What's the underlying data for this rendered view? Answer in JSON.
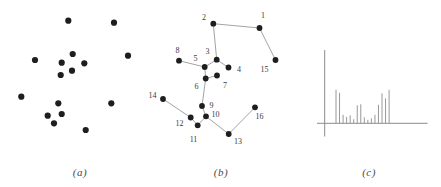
{
  "captions": {
    "a": "(a)",
    "b": "(b)",
    "c": "(c)"
  },
  "colors": {
    "dot": "#1e1e1e",
    "edge": "#999999",
    "axis": "#8c8c8c",
    "stem": "#8c8c8c",
    "node_label": "#3a3a3a",
    "caption": "#4a4a4a",
    "background": "#ffffff"
  },
  "chart_data": [
    {
      "panel": "a",
      "type": "scatter",
      "title": "(a)",
      "axes": "none",
      "points": [
        [
          68.3,
          20.7
        ],
        [
          114,
          22.7
        ],
        [
          35,
          60
        ],
        [
          72.7,
          54
        ],
        [
          61.7,
          62.7
        ],
        [
          84.3,
          63.3
        ],
        [
          128,
          55.7
        ],
        [
          60.7,
          75
        ],
        [
          72,
          70.7
        ],
        [
          21.3,
          96.7
        ],
        [
          58.3,
          103.3
        ],
        [
          111.3,
          103.3
        ],
        [
          47.7,
          115.7
        ],
        [
          61.7,
          114
        ],
        [
          54,
          123.3
        ],
        [
          85.7,
          130
        ]
      ]
    },
    {
      "panel": "b",
      "type": "scatter",
      "subtype": "minimum-spanning-tree",
      "title": "(b)",
      "axes": "none",
      "nodes": [
        {
          "id": "1",
          "x": 259.5,
          "y": 28,
          "lx": 263,
          "ly": 15.5
        },
        {
          "id": "2",
          "x": 213.3,
          "y": 23.7,
          "lx": 204,
          "ly": 17.5
        },
        {
          "id": "3",
          "x": 216.7,
          "y": 59.7,
          "lx": 207.5,
          "ly": 51.5
        },
        {
          "id": "4",
          "x": 228.5,
          "y": 67.5,
          "lx": 239,
          "ly": 69.5
        },
        {
          "id": "5",
          "x": 204.7,
          "y": 67,
          "lx": 195.5,
          "ly": 58.5
        },
        {
          "id": "6",
          "x": 205.7,
          "y": 78.5,
          "lx": 196.5,
          "ly": 86.5
        },
        {
          "id": "7",
          "x": 217,
          "y": 75.5,
          "lx": 225,
          "ly": 85
        },
        {
          "id": "8",
          "x": 179,
          "y": 60.7,
          "lx": 177.5,
          "ly": 50
        },
        {
          "id": "9",
          "x": 202,
          "y": 106,
          "lx": 211.5,
          "ly": 105
        },
        {
          "id": "10",
          "x": 206,
          "y": 116.3,
          "lx": 215.5,
          "ly": 114
        },
        {
          "id": "11",
          "x": 197.7,
          "y": 125.3,
          "lx": 193.5,
          "ly": 139
        },
        {
          "id": "12",
          "x": 190.7,
          "y": 117.5,
          "lx": 179.5,
          "ly": 123.5
        },
        {
          "id": "13",
          "x": 228.7,
          "y": 134,
          "lx": 238,
          "ly": 141.5
        },
        {
          "id": "14",
          "x": 163,
          "y": 99,
          "lx": 152.5,
          "ly": 95.5
        },
        {
          "id": "15",
          "x": 275.5,
          "y": 60,
          "lx": 264.5,
          "ly": 69
        },
        {
          "id": "16",
          "x": 255,
          "y": 107.3,
          "lx": 259.5,
          "ly": 116.5
        }
      ],
      "edges": [
        [
          "2",
          "1"
        ],
        [
          "1",
          "15"
        ],
        [
          "2",
          "3"
        ],
        [
          "3",
          "5"
        ],
        [
          "3",
          "4"
        ],
        [
          "5",
          "8"
        ],
        [
          "5",
          "6"
        ],
        [
          "6",
          "7"
        ],
        [
          "6",
          "9"
        ],
        [
          "9",
          "10"
        ],
        [
          "10",
          "11"
        ],
        [
          "11",
          "12"
        ],
        [
          "12",
          "14"
        ],
        [
          "10",
          "13"
        ],
        [
          "13",
          "16"
        ]
      ]
    },
    {
      "panel": "c",
      "type": "bar",
      "subtype": "stem",
      "title": "(c)",
      "xlabel": "",
      "ylabel": "",
      "axis_tick_labels": "none",
      "categories": [
        1,
        2,
        3,
        4,
        5,
        6,
        7,
        8,
        9,
        10,
        11,
        12,
        13,
        14,
        15,
        16
      ],
      "values": [
        33.5,
        30.5,
        8.5,
        6.5,
        8,
        4,
        18,
        19,
        6,
        3.5,
        5,
        8.5,
        18.5,
        30,
        25,
        33.5
      ],
      "units": "relative spike heights (unlabeled axes)"
    }
  ]
}
